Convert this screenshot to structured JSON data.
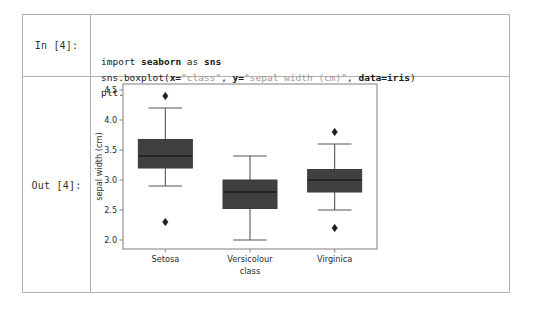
{
  "notebook": {
    "input_prompt": "In [4]:",
    "output_prompt": "Out [4]:",
    "code": {
      "line1": {
        "kw": "import",
        "lib": "seaborn",
        "as": "as",
        "alias": "sns"
      },
      "line2": {
        "call": "sns.boxplot(",
        "x_arg": "x=",
        "x_val": "\"class\"",
        "sep1": ", ",
        "y_arg": "y=",
        "y_val": "\"sepal width (cm)\"",
        "sep2": ", ",
        "data_arg": "data=iris",
        "close": ")"
      },
      "line3": "plt.show()"
    }
  },
  "chart_data": {
    "type": "box",
    "title": "",
    "xlabel": "class",
    "ylabel": "sepal width (cm)",
    "ylim": [
      1.85,
      4.6
    ],
    "yticks": [
      2.0,
      2.5,
      3.0,
      3.5,
      4.0,
      4.5
    ],
    "ytick_labels": [
      "2.0",
      "2.5",
      "3.0",
      "3.5",
      "4.0",
      "4.5"
    ],
    "categories": [
      "Setosa",
      "Versicolour",
      "Virginica"
    ],
    "grid": false,
    "legend": null,
    "box_facecolor": "#404040",
    "box_edgecolor": "#3a3a3a",
    "whisker_color": "#555555",
    "median_color": "#1a1a1a",
    "boxes": [
      {
        "category": "Setosa",
        "whisker_low": 2.9,
        "q1": 3.2,
        "median": 3.4,
        "q3": 3.675,
        "whisker_high": 4.2,
        "outliers": [
          4.4,
          2.3
        ]
      },
      {
        "category": "Versicolour",
        "whisker_low": 2.0,
        "q1": 2.525,
        "median": 2.8,
        "q3": 3.0,
        "whisker_high": 3.4,
        "outliers": []
      },
      {
        "category": "Virginica",
        "whisker_low": 2.5,
        "q1": 2.8,
        "median": 3.0,
        "q3": 3.175,
        "whisker_high": 3.6,
        "outliers": [
          3.8,
          2.2
        ]
      }
    ]
  }
}
